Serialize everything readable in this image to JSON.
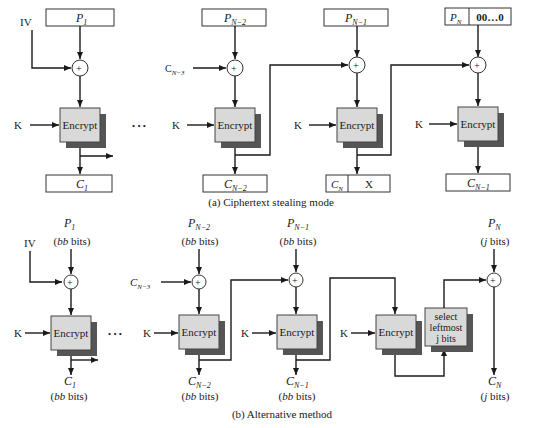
{
  "diagram": {
    "top": {
      "caption": "(a) Ciphertext stealing mode",
      "iv_label": "IV",
      "key_label": "K",
      "encrypt_label": "Encrypt",
      "ellipsis": "• • •",
      "inputs": [
        {
          "base": "P",
          "sub": "1"
        },
        {
          "base": "P",
          "sub": "N−2"
        },
        {
          "base": "P",
          "sub": "N−1"
        },
        {
          "base": "P",
          "sub": "N",
          "pad": "00…0"
        }
      ],
      "chain_input": {
        "base": "C",
        "sub": "N−3"
      },
      "outputs": [
        {
          "base": "C",
          "sub": "1"
        },
        {
          "base": "C",
          "sub": "N−2"
        },
        {
          "base": "C",
          "sub": "N",
          "extra": "X"
        },
        {
          "base": "C",
          "sub": "N−1"
        }
      ]
    },
    "bottom": {
      "caption": "(b) Alternative method",
      "iv_label": "IV",
      "key_label": "K",
      "encrypt_label": "Encrypt",
      "ellipsis": "• • •",
      "select_label": [
        "select",
        "leftmost",
        "j bits"
      ],
      "bb_bits": "(bb bits)",
      "j_bits": "(j bits)",
      "inputs": [
        {
          "base": "P",
          "sub": "1",
          "size": "bb bits"
        },
        {
          "base": "P",
          "sub": "N−2",
          "size": "bb bits"
        },
        {
          "base": "P",
          "sub": "N−1",
          "size": "bb bits"
        },
        {
          "base": "P",
          "sub": "N",
          "size": "j bits"
        }
      ],
      "chain_input": {
        "base": "C",
        "sub": "N−3"
      },
      "outputs": [
        {
          "base": "C",
          "sub": "1",
          "size": "bb bits"
        },
        {
          "base": "C",
          "sub": "N−2",
          "size": "bb bits"
        },
        {
          "base": "C",
          "sub": "N−1",
          "size": "bb bits"
        },
        {
          "base": "C",
          "sub": "N",
          "size": "j bits"
        }
      ]
    },
    "colors": {
      "encrypt_fill": "#d9d9d9",
      "shadow": "#555555",
      "line": "#1a1a1a"
    }
  }
}
